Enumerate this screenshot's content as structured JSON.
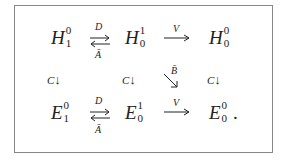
{
  "diagram": {
    "row1": [
      {
        "base": "H",
        "sup": "0",
        "sub": "1"
      },
      {
        "base": "H",
        "sup": "1",
        "sub": "0"
      },
      {
        "base": "H",
        "sup": "0",
        "sub": "0"
      }
    ],
    "row2": [
      {
        "base": "E",
        "sup": "0",
        "sub": "1"
      },
      {
        "base": "E",
        "sup": "1",
        "sub": "0"
      },
      {
        "base": "E",
        "sup": "0",
        "sub": "0",
        "trail": "."
      }
    ],
    "arrows": {
      "top_pair_upper": "D",
      "top_pair_lower": "Ā",
      "top_right": "V",
      "bottom_pair_upper": "D",
      "bottom_pair_lower": "Ā",
      "bottom_right": "V",
      "vertical": "C",
      "diagonal": "B̄",
      "down_glyph": "↓"
    }
  }
}
